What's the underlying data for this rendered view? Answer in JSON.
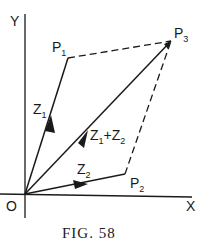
{
  "figure": {
    "caption": "FIG. 58",
    "axes": {
      "x_label": "X",
      "y_label": "Y",
      "origin_label": "O"
    },
    "points": [
      {
        "name": "P",
        "sub": "1",
        "role": "tip of z1"
      },
      {
        "name": "P",
        "sub": "2",
        "role": "tip of z2"
      },
      {
        "name": "P",
        "sub": "3",
        "role": "tip of z1+z2"
      }
    ],
    "vectors": [
      {
        "label": "Z",
        "sub": "1",
        "from": "O",
        "to": "P1",
        "style": "solid-arrow"
      },
      {
        "label": "Z",
        "sub": "2",
        "from": "O",
        "to": "P2",
        "style": "solid-arrow"
      },
      {
        "label_parts": [
          "Z",
          "1",
          "+Z",
          "2"
        ],
        "from": "O",
        "to": "P3",
        "style": "solid-arrow"
      }
    ],
    "dashed_edges": [
      {
        "from": "P1",
        "to": "P3"
      },
      {
        "from": "P2",
        "to": "P3"
      }
    ],
    "colors": {
      "ink": "#1a1a1a",
      "background": "#ffffff"
    }
  }
}
